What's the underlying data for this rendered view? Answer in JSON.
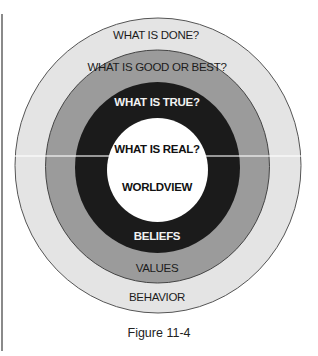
{
  "figure": {
    "caption": "Figure 11-4",
    "colors": {
      "outer_ring": "#e4e4e4",
      "middle_ring": "#9b9b9b",
      "inner_ring": "#1b1b1b",
      "core": "#ffffff",
      "stroke": "#555555"
    },
    "rings": [
      {
        "name": "behavior",
        "question": "WHAT IS DONE?",
        "label": "BEHAVIOR"
      },
      {
        "name": "values",
        "question": "WHAT IS GOOD OR BEST?",
        "label": "VALUES"
      },
      {
        "name": "beliefs",
        "question": "WHAT IS TRUE?",
        "label": "BELIEFS"
      },
      {
        "name": "worldview",
        "question": "WHAT IS REAL?",
        "label": "WORLDVIEW"
      }
    ]
  }
}
